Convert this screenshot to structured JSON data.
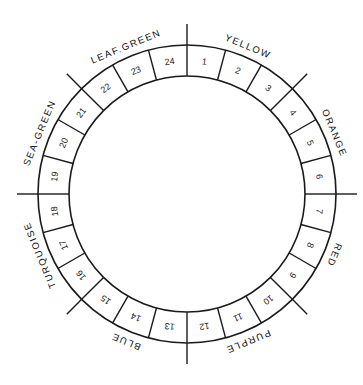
{
  "diagram": {
    "type": "color-wheel",
    "geometry": {
      "center": [
        187,
        194
      ],
      "outer_radius": 149,
      "inner_radius": 118,
      "tick_extension": 21,
      "label_radius": 160,
      "segment_count": 24,
      "start_angle_deg": 0,
      "direction": "clockwise"
    },
    "colors": {
      "stroke": "#1a1a1a",
      "text": "#222222",
      "background": "#ffffff"
    },
    "segments": [
      {
        "number": "1",
        "group": "YELLOW"
      },
      {
        "number": "2",
        "group": "YELLOW"
      },
      {
        "number": "3",
        "group": "YELLOW"
      },
      {
        "number": "4",
        "group": "ORANGE"
      },
      {
        "number": "5",
        "group": "ORANGE"
      },
      {
        "number": "6",
        "group": "ORANGE"
      },
      {
        "number": "7",
        "group": "RED"
      },
      {
        "number": "8",
        "group": "RED"
      },
      {
        "number": "9",
        "group": "RED"
      },
      {
        "number": "10",
        "group": "PURPLE"
      },
      {
        "number": "11",
        "group": "PURPLE"
      },
      {
        "number": "12",
        "group": "PURPLE"
      },
      {
        "number": "13",
        "group": "BLUE"
      },
      {
        "number": "14",
        "group": "BLUE"
      },
      {
        "number": "15",
        "group": "BLUE"
      },
      {
        "number": "16",
        "group": "TURQUOISE"
      },
      {
        "number": "17",
        "group": "TURQUOISE"
      },
      {
        "number": "18",
        "group": "TURQUOISE"
      },
      {
        "number": "19",
        "group": "SEA-GREEN"
      },
      {
        "number": "20",
        "group": "SEA-GREEN"
      },
      {
        "number": "21",
        "group": "SEA-GREEN"
      },
      {
        "number": "22",
        "group": "LEAF.GREEN"
      },
      {
        "number": "23",
        "group": "LEAF.GREEN"
      },
      {
        "number": "24",
        "group": "LEAF.GREEN"
      }
    ],
    "groups": [
      {
        "label": "YELLOW",
        "segments": [
          "1",
          "2",
          "3"
        ]
      },
      {
        "label": "ORANGE",
        "segments": [
          "4",
          "5",
          "6"
        ]
      },
      {
        "label": "RED",
        "segments": [
          "7",
          "8",
          "9"
        ]
      },
      {
        "label": "PURPLE",
        "segments": [
          "10",
          "11",
          "12"
        ]
      },
      {
        "label": "BLUE",
        "segments": [
          "13",
          "14",
          "15"
        ]
      },
      {
        "label": "TURQUOISE",
        "segments": [
          "16",
          "17",
          "18"
        ]
      },
      {
        "label": "SEA-GREEN",
        "segments": [
          "19",
          "20",
          "21"
        ]
      },
      {
        "label": "LEAF.GREEN",
        "segments": [
          "22",
          "23",
          "24"
        ]
      }
    ]
  }
}
